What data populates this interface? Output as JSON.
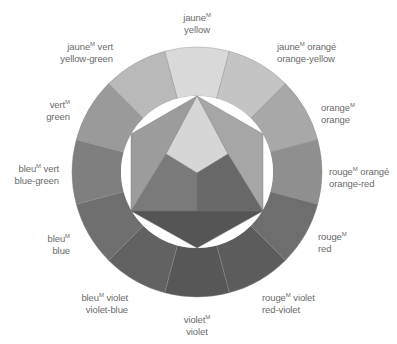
{
  "diagram": {
    "title": "",
    "center": [
      197,
      172
    ],
    "outer_radius": 125,
    "inner_radius": 76,
    "segments": [
      {
        "id": "yellow",
        "french": "jaune",
        "french_suffix": "",
        "english": "yellow",
        "color": "#d9d9d9"
      },
      {
        "id": "orange-yellow",
        "french": "jaune",
        "french_suffix": " orangé",
        "english": "orange-yellow",
        "color": "#c4c4c4"
      },
      {
        "id": "orange",
        "french": "orange",
        "french_suffix": "",
        "english": "orange",
        "color": "#a8a8a8"
      },
      {
        "id": "orange-red",
        "french": "rouge",
        "french_suffix": " orangé",
        "english": "orange-red",
        "color": "#8f8f8f"
      },
      {
        "id": "red",
        "french": "rouge",
        "french_suffix": "",
        "english": "red",
        "color": "#6e6e6e"
      },
      {
        "id": "red-violet",
        "french": "rouge",
        "french_suffix": " violet",
        "english": "red-violet",
        "color": "#5c5c5c"
      },
      {
        "id": "violet",
        "french": "violet",
        "french_suffix": "",
        "english": "violet",
        "color": "#575757"
      },
      {
        "id": "violet-blue",
        "french": "bleu",
        "french_suffix": " violet",
        "english": "violet-blue",
        "color": "#626262"
      },
      {
        "id": "blue",
        "french": "bleu",
        "french_suffix": "",
        "english": "blue",
        "color": "#6f6f6f"
      },
      {
        "id": "blue-green",
        "french": "bleu",
        "french_suffix": " vert",
        "english": "blue-green",
        "color": "#7f7f7f"
      },
      {
        "id": "green",
        "french": "vert",
        "french_suffix": "",
        "english": "green",
        "color": "#9a9a9a"
      },
      {
        "id": "yellow-green",
        "french": "jaune",
        "french_suffix": " vert",
        "english": "yellow-green",
        "color": "#b9b9b9"
      }
    ],
    "superscript": "M",
    "hexagon": {
      "yellow_color": "#d6d6d6",
      "orange_color": "#a6a6a6",
      "green_color": "#9c9c9c",
      "blue_color": "#7a7a7a",
      "red_color": "#686868",
      "violet_color": "#555555"
    }
  },
  "labels": [
    {
      "seg": 0,
      "x": 197,
      "y": 12,
      "align": "c"
    },
    {
      "seg": 1,
      "x": 277,
      "y": 41,
      "align": "l"
    },
    {
      "seg": 2,
      "x": 321,
      "y": 102,
      "align": "l"
    },
    {
      "seg": 3,
      "x": 329,
      "y": 166,
      "align": "l"
    },
    {
      "seg": 4,
      "x": 318,
      "y": 231,
      "align": "l"
    },
    {
      "seg": 5,
      "x": 262,
      "y": 292,
      "align": "l"
    },
    {
      "seg": 6,
      "x": 197,
      "y": 314,
      "align": "c"
    },
    {
      "seg": 7,
      "x": 128,
      "y": 292,
      "align": "r"
    },
    {
      "seg": 8,
      "x": 70,
      "y": 233,
      "align": "r"
    },
    {
      "seg": 9,
      "x": 59,
      "y": 163,
      "align": "r"
    },
    {
      "seg": 10,
      "x": 70,
      "y": 99,
      "align": "r"
    },
    {
      "seg": 11,
      "x": 113,
      "y": 41,
      "align": "r"
    }
  ]
}
